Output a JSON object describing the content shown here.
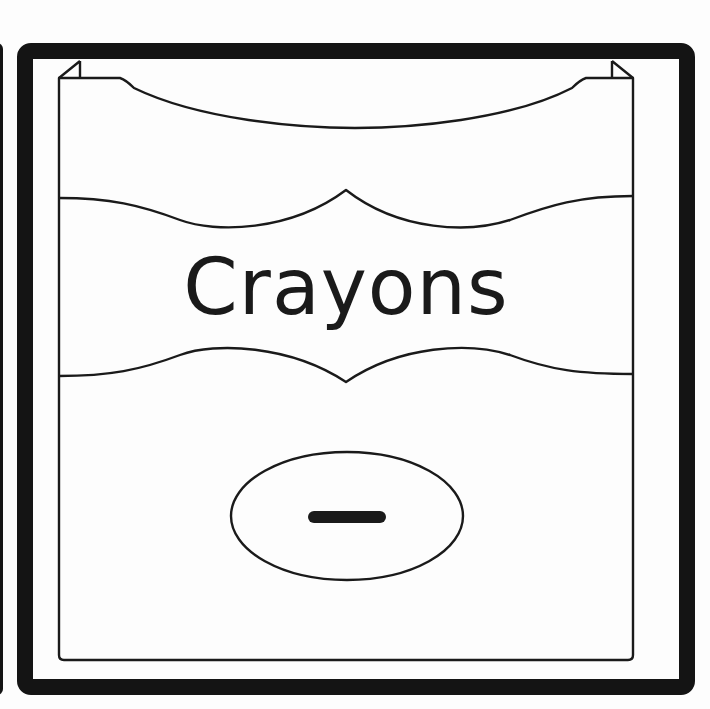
{
  "card": {
    "title": "Crayons",
    "colors": {
      "frame": "#141414",
      "line": "#1a1a1a",
      "background": "#fdfdfd",
      "dash": "#1a1a1a"
    }
  },
  "icons": {
    "box": "crayon-box-icon",
    "label_oval": "oval-label-icon",
    "dash": "dash-icon"
  }
}
